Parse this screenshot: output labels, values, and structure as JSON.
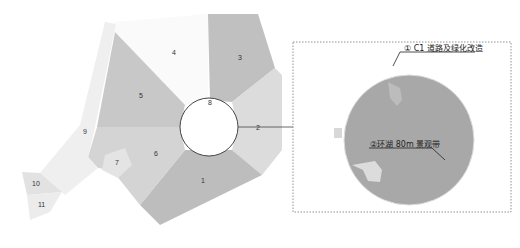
{
  "map": {
    "zones": [
      {
        "id": "1",
        "label": "1"
      },
      {
        "id": "2",
        "label": "2"
      },
      {
        "id": "3",
        "label": "3"
      },
      {
        "id": "4",
        "label": "4"
      },
      {
        "id": "5",
        "label": "5"
      },
      {
        "id": "6",
        "label": "6"
      },
      {
        "id": "7",
        "label": "7"
      },
      {
        "id": "8",
        "label": "8"
      },
      {
        "id": "9",
        "label": "9"
      },
      {
        "id": "10",
        "label": "10"
      },
      {
        "id": "11",
        "label": "11"
      }
    ]
  },
  "detail": {
    "callout_1": "① C1 道路及绿化改造",
    "callout_2": "②环湖 80m 景观带"
  },
  "colors": {
    "dark_zone": "#b8b8b8",
    "mid_zone": "#cfcfcf",
    "light_zone": "#e6e6e6",
    "lake": "#a7a7a7"
  }
}
